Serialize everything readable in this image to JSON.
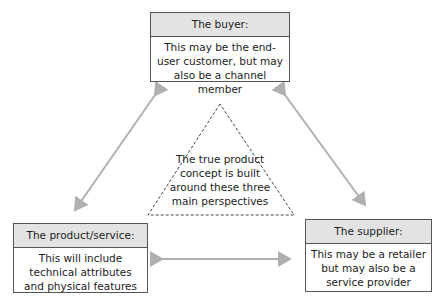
{
  "diagram": {
    "buyer": {
      "title": "The buyer:",
      "description": "This may be the end-user customer, but may also be a channel member"
    },
    "product": {
      "title": "The product/service:",
      "description": "This will include technical attributes and physical features"
    },
    "supplier": {
      "title": "The supplier:",
      "description": "This may be a retailer but may also be a service provider"
    },
    "center": {
      "text": "The true product concept is built around these three main perspectives"
    },
    "colors": {
      "header_bg": "#e3e3e3",
      "border": "#555555",
      "arrow": "#b0b0b0"
    }
  }
}
